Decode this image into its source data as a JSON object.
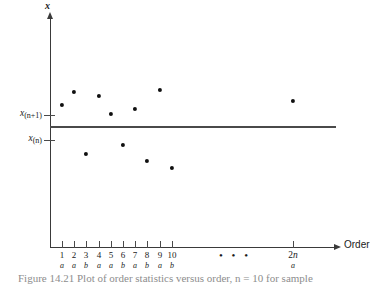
{
  "figure": {
    "axis_label_y": "x",
    "axis_label_x": "Order",
    "ellipsis": "• • •",
    "caption": "Figure 14.21   Plot of order statistics versus order, n = 10 for sample"
  },
  "y_axis": {
    "ticks": [
      {
        "name": "upper",
        "text_main": "x",
        "text_sub": "(n+1)"
      },
      {
        "name": "lower",
        "text_main": "x",
        "text_sub": "(n)"
      }
    ]
  },
  "x_axis": {
    "ticks": [
      {
        "label": "1",
        "sublabel": "a"
      },
      {
        "label": "2",
        "sublabel": "a"
      },
      {
        "label": "3",
        "sublabel": "b"
      },
      {
        "label": "4",
        "sublabel": "a"
      },
      {
        "label": "5",
        "sublabel": "a"
      },
      {
        "label": "6",
        "sublabel": "b"
      },
      {
        "label": "7",
        "sublabel": "a"
      },
      {
        "label": "8",
        "sublabel": "b"
      },
      {
        "label": "9",
        "sublabel": "a"
      },
      {
        "label": "10",
        "sublabel": "b"
      },
      {
        "label": "2n",
        "sublabel": "a"
      }
    ]
  },
  "chart_data": {
    "type": "scatter",
    "title": "",
    "xlabel": "Order",
    "ylabel": "x",
    "categories": [
      "1",
      "2",
      "3",
      "4",
      "5",
      "6",
      "7",
      "8",
      "9",
      "10",
      "2n"
    ],
    "group_labels": [
      "a",
      "a",
      "b",
      "a",
      "a",
      "b",
      "a",
      "b",
      "a",
      "b",
      "a"
    ],
    "points": [
      {
        "order": "1",
        "px": 62,
        "py": 105,
        "group": "a",
        "above_threshold": true
      },
      {
        "order": "2",
        "px": 74,
        "py": 92,
        "group": "a",
        "above_threshold": true
      },
      {
        "order": "3",
        "px": 86,
        "py": 154,
        "group": "b",
        "above_threshold": false
      },
      {
        "order": "4",
        "px": 99,
        "py": 96,
        "group": "a",
        "above_threshold": true
      },
      {
        "order": "5",
        "px": 111,
        "py": 114,
        "group": "a",
        "above_threshold": true
      },
      {
        "order": "6",
        "px": 123,
        "py": 145,
        "group": "b",
        "above_threshold": false
      },
      {
        "order": "7",
        "px": 135,
        "py": 109,
        "group": "a",
        "above_threshold": true
      },
      {
        "order": "8",
        "px": 147,
        "py": 161,
        "group": "b",
        "above_threshold": false
      },
      {
        "order": "9",
        "px": 160,
        "py": 90,
        "group": "a",
        "above_threshold": true
      },
      {
        "order": "10",
        "px": 172,
        "py": 168,
        "group": "b",
        "above_threshold": false
      },
      {
        "order": "2n",
        "px": 293,
        "py": 101,
        "group": "a",
        "above_threshold": true
      }
    ],
    "threshold_line": {
      "y_px": 126,
      "label": "median cut between x_(n) and x_(n+1)"
    },
    "grid": false,
    "legend": "none",
    "colors": {
      "point": "#101010",
      "axis": "#3a3a3a",
      "line": "#4a4a4a"
    }
  }
}
